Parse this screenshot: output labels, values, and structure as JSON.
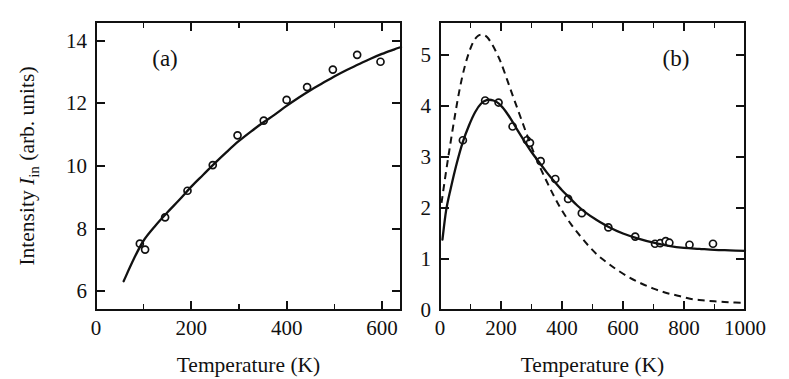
{
  "figure": {
    "background_color": "#ffffff",
    "ink_color": "#111111",
    "panel_count": 2
  },
  "chart_data": [
    {
      "type": "scatter",
      "panel": "a",
      "panel_label": "(a)",
      "title": "",
      "xlabel": "Temperature  (K)",
      "ylabel": "Intensity  I_in  (arb. units)",
      "ylabel_parts": {
        "pre": "Intensity ",
        "symbol": "I",
        "subscript": "in",
        "post": " (arb. units)"
      },
      "xlim": [
        0,
        640
      ],
      "ylim": [
        5.4,
        14.6
      ],
      "xticks": [
        0,
        200,
        400,
        600
      ],
      "xticklabels": [
        "0",
        "200",
        "400",
        "600"
      ],
      "xminorticks": [
        100,
        300,
        500
      ],
      "yticks": [
        6,
        8,
        10,
        12,
        14
      ],
      "yticklabels": [
        "6",
        "8",
        "10",
        "12",
        "14"
      ],
      "grid": false,
      "legend": "none",
      "series": [
        {
          "name": "measured intensity",
          "style": "open-circles",
          "points": [
            [
              92,
              7.52
            ],
            [
              103,
              7.33
            ],
            [
              145,
              8.36
            ],
            [
              192,
              9.21
            ],
            [
              245,
              10.03
            ],
            [
              297,
              10.98
            ],
            [
              352,
              11.45
            ],
            [
              400,
              12.11
            ],
            [
              443,
              12.52
            ],
            [
              497,
              13.08
            ],
            [
              548,
              13.55
            ],
            [
              597,
              13.33
            ]
          ]
        },
        {
          "name": "fit curve",
          "style": "solid-line",
          "points": [
            [
              58,
              6.32
            ],
            [
              80,
              7.05
            ],
            [
              100,
              7.62
            ],
            [
              125,
              8.1
            ],
            [
              150,
              8.52
            ],
            [
              175,
              8.92
            ],
            [
              200,
              9.34
            ],
            [
              225,
              9.72
            ],
            [
              250,
              10.1
            ],
            [
              275,
              10.46
            ],
            [
              300,
              10.8
            ],
            [
              325,
              11.1
            ],
            [
              350,
              11.38
            ],
            [
              375,
              11.64
            ],
            [
              400,
              11.92
            ],
            [
              425,
              12.18
            ],
            [
              450,
              12.42
            ],
            [
              475,
              12.64
            ],
            [
              500,
              12.86
            ],
            [
              525,
              13.06
            ],
            [
              550,
              13.24
            ],
            [
              575,
              13.42
            ],
            [
              600,
              13.58
            ],
            [
              625,
              13.72
            ],
            [
              640,
              13.8
            ]
          ]
        }
      ]
    },
    {
      "type": "scatter",
      "panel": "b",
      "panel_label": "(b)",
      "title": "",
      "xlabel": "Temperature  (K)",
      "ylabel": "",
      "xlim": [
        0,
        1000
      ],
      "ylim": [
        0,
        5.65
      ],
      "xticks": [
        0,
        200,
        400,
        600,
        800,
        1000
      ],
      "xticklabels": [
        "0",
        "200",
        "400",
        "600",
        "800",
        "1000"
      ],
      "xminorticks": [
        100,
        300,
        500,
        700,
        900
      ],
      "yticks": [
        0,
        1,
        2,
        3,
        4,
        5
      ],
      "yticklabels": [
        "0",
        "1",
        "2",
        "3",
        "4",
        "5"
      ],
      "grid": false,
      "legend": "none",
      "series": [
        {
          "name": "measured ratio",
          "style": "open-circles",
          "points": [
            [
              75,
              3.33
            ],
            [
              148,
              4.11
            ],
            [
              192,
              4.07
            ],
            [
              238,
              3.6
            ],
            [
              285,
              3.33
            ],
            [
              295,
              3.28
            ],
            [
              330,
              2.92
            ],
            [
              378,
              2.57
            ],
            [
              420,
              2.18
            ],
            [
              465,
              1.9
            ],
            [
              552,
              1.62
            ],
            [
              640,
              1.44
            ],
            [
              705,
              1.3
            ],
            [
              722,
              1.31
            ],
            [
              740,
              1.35
            ],
            [
              752,
              1.32
            ],
            [
              818,
              1.28
            ],
            [
              895,
              1.3
            ]
          ]
        },
        {
          "name": "solid fit",
          "style": "solid-line",
          "points": [
            [
              8,
              1.38
            ],
            [
              20,
              1.95
            ],
            [
              35,
              2.38
            ],
            [
              55,
              2.88
            ],
            [
              75,
              3.3
            ],
            [
              95,
              3.62
            ],
            [
              115,
              3.88
            ],
            [
              135,
              4.05
            ],
            [
              155,
              4.12
            ],
            [
              175,
              4.11
            ],
            [
              195,
              4.04
            ],
            [
              215,
              3.9
            ],
            [
              235,
              3.72
            ],
            [
              255,
              3.52
            ],
            [
              275,
              3.33
            ],
            [
              300,
              3.1
            ],
            [
              325,
              2.9
            ],
            [
              350,
              2.7
            ],
            [
              375,
              2.52
            ],
            [
              400,
              2.35
            ],
            [
              425,
              2.2
            ],
            [
              450,
              2.05
            ],
            [
              480,
              1.9
            ],
            [
              510,
              1.78
            ],
            [
              550,
              1.64
            ],
            [
              600,
              1.5
            ],
            [
              650,
              1.4
            ],
            [
              700,
              1.32
            ],
            [
              750,
              1.26
            ],
            [
              800,
              1.22
            ],
            [
              850,
              1.2
            ],
            [
              900,
              1.18
            ],
            [
              950,
              1.17
            ],
            [
              1000,
              1.16
            ]
          ]
        },
        {
          "name": "theory (dashed)",
          "style": "dashed-line",
          "points": [
            [
              5,
              2.1
            ],
            [
              20,
              2.72
            ],
            [
              35,
              3.3
            ],
            [
              50,
              3.85
            ],
            [
              65,
              4.35
            ],
            [
              80,
              4.75
            ],
            [
              95,
              5.05
            ],
            [
              110,
              5.27
            ],
            [
              125,
              5.38
            ],
            [
              140,
              5.4
            ],
            [
              155,
              5.35
            ],
            [
              170,
              5.22
            ],
            [
              185,
              5.05
            ],
            [
              200,
              4.85
            ],
            [
              220,
              4.52
            ],
            [
              240,
              4.18
            ],
            [
              260,
              3.85
            ],
            [
              280,
              3.52
            ],
            [
              300,
              3.2
            ],
            [
              325,
              2.84
            ],
            [
              350,
              2.52
            ],
            [
              375,
              2.22
            ],
            [
              400,
              1.95
            ],
            [
              430,
              1.68
            ],
            [
              460,
              1.45
            ],
            [
              490,
              1.24
            ],
            [
              520,
              1.06
            ],
            [
              550,
              0.92
            ],
            [
              580,
              0.79
            ],
            [
              620,
              0.64
            ],
            [
              660,
              0.52
            ],
            [
              700,
              0.42
            ],
            [
              740,
              0.34
            ],
            [
              780,
              0.28
            ],
            [
              820,
              0.22
            ],
            [
              860,
              0.19
            ],
            [
              900,
              0.17
            ],
            [
              950,
              0.15
            ],
            [
              1000,
              0.14
            ]
          ]
        }
      ]
    }
  ]
}
